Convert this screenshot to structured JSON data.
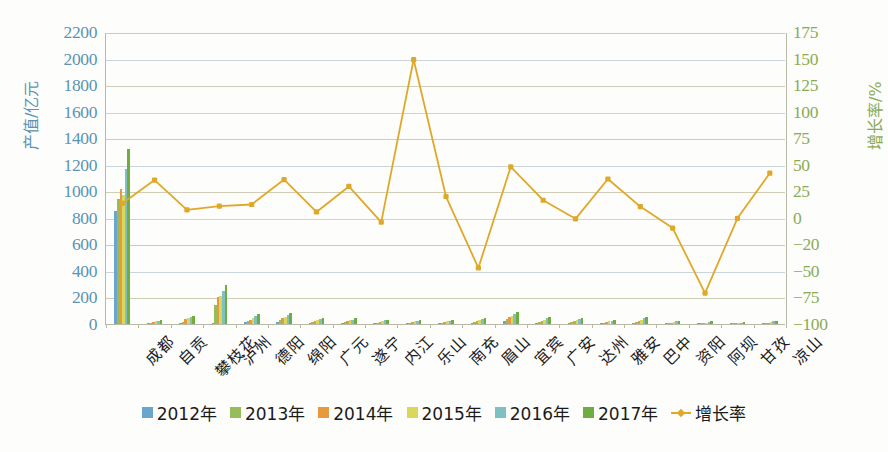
{
  "chart_data": {
    "type": "bar",
    "title": "",
    "xlabel": "",
    "ylabel": "产值/亿元",
    "ylabel_right": "增长率/%",
    "ylim": [
      0,
      2200
    ],
    "ylim_right": [
      -100,
      175
    ],
    "grid": true,
    "legend_position": "bottom",
    "categories": [
      "成都",
      "自贡",
      "攀枝花",
      "泸州",
      "德阳",
      "绵阳",
      "广元",
      "遂宁",
      "内江",
      "乐山",
      "南充",
      "眉山",
      "宜宾",
      "广安",
      "达州",
      "雅安",
      "巴中",
      "资阳",
      "阿坝",
      "甘孜",
      "凉山"
    ],
    "left_axis_ticks": [
      0,
      200,
      400,
      600,
      800,
      1000,
      1200,
      1400,
      1600,
      1800,
      2000,
      2200
    ],
    "right_axis_ticks": [
      -100,
      -75,
      -50,
      -20,
      0,
      25,
      50,
      75,
      100,
      125,
      150,
      175
    ],
    "series": [
      {
        "name": "2012年",
        "color": "#6aa6cc",
        "values": [
          850,
          6,
          8,
          10,
          12,
          18,
          8,
          7,
          6,
          5,
          4,
          6,
          22,
          10,
          7,
          5,
          9,
          4,
          3,
          2,
          4
        ]
      },
      {
        "name": "2013年",
        "color": "#97bc5a",
        "values": [
          940,
          9,
          14,
          140,
          22,
          30,
          14,
          12,
          10,
          9,
          8,
          12,
          38,
          16,
          13,
          9,
          16,
          7,
          5,
          3,
          7
        ]
      },
      {
        "name": "2014年",
        "color": "#e8993f",
        "values": [
          1020,
          14,
          36,
          200,
          34,
          42,
          22,
          20,
          16,
          14,
          14,
          20,
          50,
          26,
          20,
          14,
          24,
          11,
          8,
          5,
          11
        ]
      },
      {
        "name": "2015年",
        "color": "#d8d85a",
        "values": [
          970,
          20,
          44,
          210,
          46,
          56,
          30,
          28,
          22,
          20,
          20,
          28,
          62,
          34,
          28,
          20,
          32,
          16,
          11,
          7,
          15
        ]
      },
      {
        "name": "2016年",
        "color": "#7ec0c4",
        "values": [
          1170,
          26,
          52,
          250,
          58,
          70,
          38,
          34,
          28,
          26,
          26,
          36,
          78,
          44,
          36,
          26,
          42,
          21,
          15,
          9,
          19
        ]
      },
      {
        "name": "2017年",
        "color": "#6fae3e",
        "values": [
          1320,
          32,
          60,
          292,
          72,
          86,
          46,
          42,
          34,
          32,
          32,
          44,
          92,
          54,
          44,
          32,
          52,
          26,
          19,
          12,
          24
        ]
      }
    ],
    "line_series": {
      "name": "增长率",
      "color": "#e0a829",
      "values": [
        14.5,
        36.5,
        8.5,
        12.0,
        13.5,
        37.0,
        6.5,
        30.5,
        -2.5,
        150.0,
        21.0,
        -45.5,
        49.0,
        17.5,
        0.0,
        37.5,
        11.5,
        -7.0,
        -70.0,
        0.5,
        43.0
      ]
    }
  },
  "legend": [
    {
      "label": "2012年",
      "color": "#6aa6cc",
      "marker": "square"
    },
    {
      "label": "2013年",
      "color": "#97bc5a",
      "marker": "square"
    },
    {
      "label": "2014年",
      "color": "#e8993f",
      "marker": "square"
    },
    {
      "label": "2015年",
      "color": "#d8d85a",
      "marker": "square"
    },
    {
      "label": "2016年",
      "color": "#7ec0c4",
      "marker": "square"
    },
    {
      "label": "2017年",
      "color": "#6fae3e",
      "marker": "square"
    },
    {
      "label": "增长率",
      "color": "#e0a829",
      "marker": "line"
    }
  ],
  "colors": {
    "left_axis_text": "#5b93b5",
    "right_axis_text": "#8aab55",
    "grid": "#c9d4db",
    "line": "#e0a829",
    "background": "#fdfdfb"
  }
}
